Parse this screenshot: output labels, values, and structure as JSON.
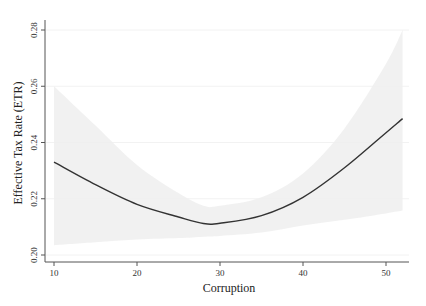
{
  "chart_data": {
    "type": "line",
    "title": "",
    "xlabel": "Corruption",
    "ylabel": "Effective Tax Rate (ETR)",
    "xlim": [
      9.8,
      52.5
    ],
    "ylim": [
      0.2,
      0.28
    ],
    "x_ticks": [
      10,
      20,
      30,
      40,
      50
    ],
    "x_tick_labels": [
      "10",
      "20",
      "30",
      "40",
      "50"
    ],
    "y_ticks": [
      0.2,
      0.22,
      0.24,
      0.26,
      0.28
    ],
    "y_tick_labels": [
      "0.20",
      "0.22",
      "0.24",
      "0.26",
      "0.28"
    ],
    "grid": "horizontal, faint",
    "legend": "none",
    "series": [
      {
        "name": "Fitted ETR (quadratic)",
        "x": [
          10,
          15,
          20,
          25,
          28,
          30,
          35,
          40,
          45,
          50,
          52
        ],
        "values": [
          0.233,
          0.225,
          0.218,
          0.2135,
          0.2112,
          0.2113,
          0.214,
          0.2205,
          0.231,
          0.2435,
          0.2485
        ],
        "color": "#333333"
      },
      {
        "name": "95% CI upper",
        "x": [
          10,
          15,
          20,
          25,
          28,
          30,
          35,
          40,
          45,
          50,
          52
        ],
        "values": [
          0.26,
          0.246,
          0.232,
          0.222,
          0.2175,
          0.2175,
          0.2205,
          0.229,
          0.245,
          0.268,
          0.28
        ],
        "color": "#f0f0f0"
      },
      {
        "name": "95% CI lower",
        "x": [
          10,
          15,
          20,
          25,
          28,
          30,
          35,
          40,
          45,
          50,
          52
        ],
        "values": [
          0.2035,
          0.2045,
          0.2055,
          0.206,
          0.2065,
          0.2068,
          0.208,
          0.2105,
          0.2125,
          0.2148,
          0.2158
        ],
        "color": "#f0f0f0"
      }
    ]
  }
}
